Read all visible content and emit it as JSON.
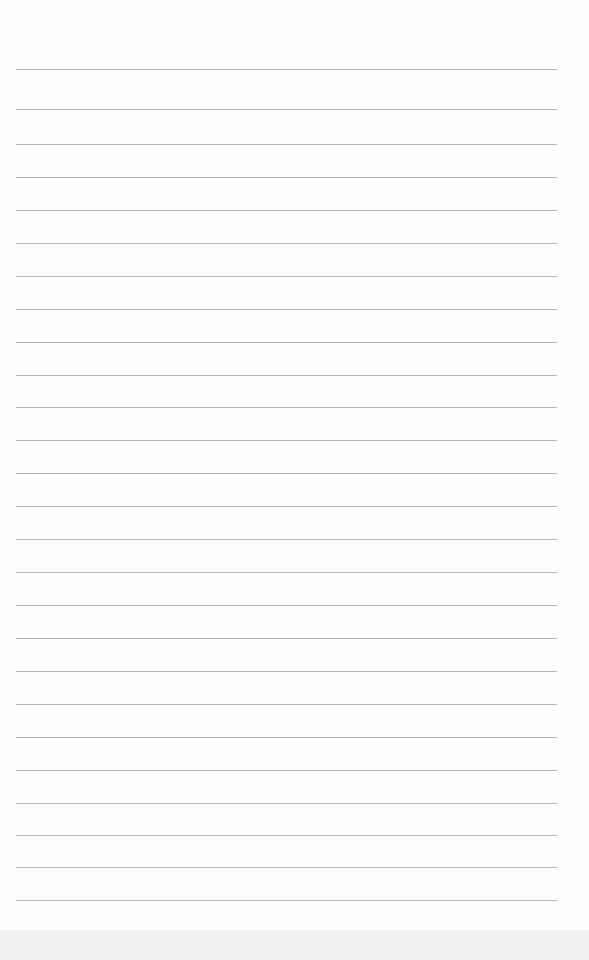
{
  "paper": {
    "type": "lined-paper",
    "line_color": "#b4b4b4",
    "background": "#fefefe",
    "line_left": 16,
    "line_width": 541,
    "lines_y": [
      69,
      109,
      144,
      177,
      210,
      243,
      276,
      309,
      342,
      375,
      407,
      440,
      473,
      506,
      539,
      572,
      605,
      638,
      671,
      704,
      737,
      770,
      803,
      835,
      867,
      900
    ]
  }
}
